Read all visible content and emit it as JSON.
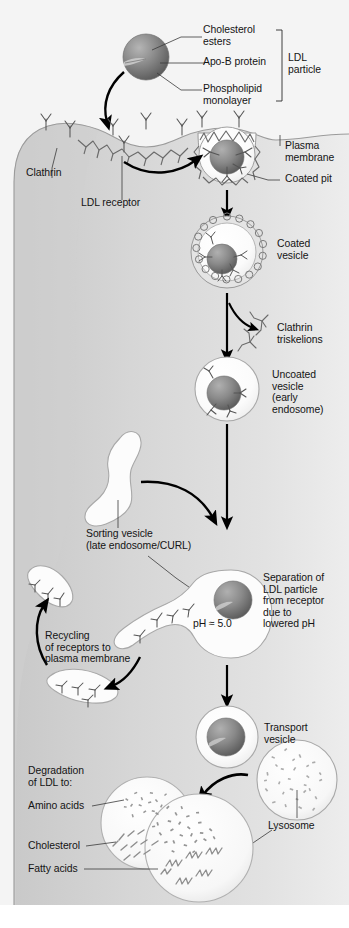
{
  "figure": {
    "width": 349,
    "height": 928,
    "background": "#ffffff"
  },
  "palette": {
    "extracellular": "#f2f2f2",
    "cytoplasm": "#d8d8d8",
    "membrane_line": "#8a8a8a",
    "vesicle_fill": "#fdfdfd",
    "ldl_core_light": "#9a9a9a",
    "ldl_core_dark": "#5d5d5d",
    "text": "#141414",
    "arrow": "#000000",
    "leader_line": "#3a3a3a"
  },
  "labels": {
    "cholesterol_esters": "Cholesterol\nesters",
    "apo_b_protein": "Apo-B protein",
    "phospholipid_monolayer": "Phospholipid\nmonolayer",
    "ldl_particle": "LDL\nparticle",
    "plasma_membrane": "Plasma\nmembrane",
    "coated_pit": "Coated pit",
    "clathrin": "Clathrin",
    "ldl_receptor": "LDL receptor",
    "coated_vesicle": "Coated\nvesicle",
    "clathrin_triskelions": "Clathrin\ntriskelions",
    "uncoated_vesicle": "Uncoated\nvesicle\n(early\nendosome)",
    "sorting_vesicle": "Sorting vesicle\n(late endosome/CURL)",
    "separation": "Separation of\nLDL particle\nfrom receptor\ndue to\nlowered pH",
    "ph_value": "pH ≈ 5.0",
    "recycling": "Recycling\nof receptors to\nplasma membrane",
    "transport_vesicle": "Transport\nvesicle",
    "lysosome": "Lysosome",
    "degradation": "Degradation\nof LDL to:",
    "amino_acids": "Amino acids",
    "cholesterol": "Cholesterol",
    "fatty_acids": "Fatty acids"
  },
  "steps": [
    {
      "id": "ldl-particle",
      "label": "LDL particle"
    },
    {
      "id": "coated-pit",
      "label": "Coated pit"
    },
    {
      "id": "coated-vesicle",
      "label": "Coated vesicle"
    },
    {
      "id": "uncoated-vesicle",
      "label": "Uncoated vesicle (early endosome)"
    },
    {
      "id": "sorting-vesicle",
      "label": "Sorting vesicle (late endosome/CURL)"
    },
    {
      "id": "transport-vesicle",
      "label": "Transport vesicle"
    },
    {
      "id": "lysosome",
      "label": "Lysosome"
    }
  ],
  "products": [
    "Amino acids",
    "Cholesterol",
    "Fatty acids"
  ]
}
